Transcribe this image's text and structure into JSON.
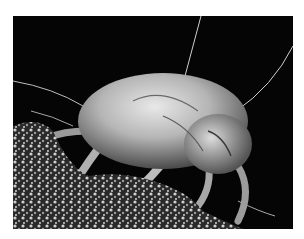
{
  "image": {
    "subject": "Scanning electron micrograph of a dust mite on a textured surface",
    "alt": "Dust mite SEM image",
    "background_color": "#050505",
    "frame_color": "#ffffff"
  }
}
